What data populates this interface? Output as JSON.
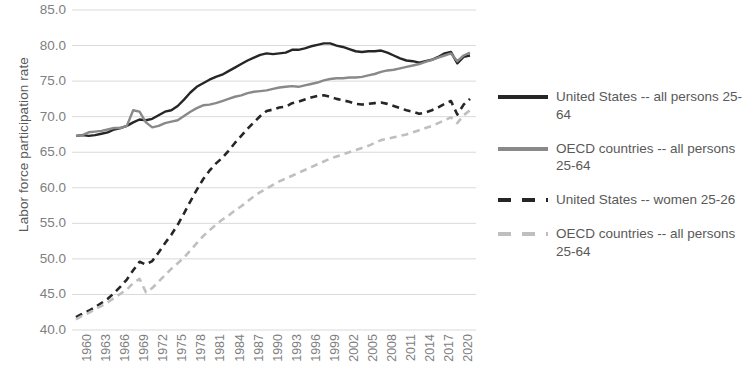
{
  "chart_data": {
    "type": "line",
    "title": "",
    "xlabel": "",
    "ylabel": "Labor force participation rate",
    "ylim": [
      40.0,
      85.0
    ],
    "ytick_step": 5.0,
    "ytick_labels": [
      "85.0",
      "80.0",
      "75.0",
      "70.0",
      "65.0",
      "60.0",
      "55.0",
      "50.0",
      "45.0",
      "40.0"
    ],
    "ytick_values": [
      85.0,
      80.0,
      75.0,
      70.0,
      65.0,
      60.0,
      55.0,
      50.0,
      45.0,
      40.0
    ],
    "xlim": [
      1960,
      2022
    ],
    "xtick_labels": [
      "1960",
      "1963",
      "1966",
      "1969",
      "1972",
      "1975",
      "1978",
      "1981",
      "1984",
      "1987",
      "1990",
      "1993",
      "1996",
      "1999",
      "2002",
      "2005",
      "2008",
      "2011",
      "2014",
      "2017",
      "2020"
    ],
    "xtick_values": [
      1960,
      1963,
      1966,
      1969,
      1972,
      1975,
      1978,
      1981,
      1984,
      1987,
      1990,
      1993,
      1996,
      1999,
      2002,
      2005,
      2008,
      2011,
      2014,
      2017,
      2020
    ],
    "grid": "horizontal",
    "legend_position": "right",
    "x": [
      1960,
      1961,
      1962,
      1963,
      1964,
      1965,
      1966,
      1967,
      1968,
      1969,
      1970,
      1971,
      1972,
      1973,
      1974,
      1975,
      1976,
      1977,
      1978,
      1979,
      1980,
      1981,
      1982,
      1983,
      1984,
      1985,
      1986,
      1987,
      1988,
      1989,
      1990,
      1991,
      1992,
      1993,
      1994,
      1995,
      1996,
      1997,
      1998,
      1999,
      2000,
      2001,
      2002,
      2003,
      2004,
      2005,
      2006,
      2007,
      2008,
      2009,
      2010,
      2011,
      2012,
      2013,
      2014,
      2015,
      2016,
      2017,
      2018,
      2019,
      2020,
      2021,
      2022
    ],
    "series": [
      {
        "name": "United States -- all persons 25-64",
        "color": "#262626",
        "style": "solid",
        "values": [
          67.3,
          67.4,
          67.3,
          67.4,
          67.6,
          67.8,
          68.2,
          68.4,
          68.7,
          69.2,
          69.6,
          69.5,
          69.7,
          70.2,
          70.7,
          70.9,
          71.5,
          72.4,
          73.4,
          74.2,
          74.7,
          75.2,
          75.6,
          75.9,
          76.4,
          76.9,
          77.4,
          77.9,
          78.3,
          78.7,
          78.9,
          78.8,
          78.9,
          79.0,
          79.4,
          79.4,
          79.6,
          79.9,
          80.1,
          80.3,
          80.3,
          80.0,
          79.8,
          79.5,
          79.2,
          79.1,
          79.2,
          79.2,
          79.3,
          79.0,
          78.6,
          78.2,
          77.9,
          77.8,
          77.6,
          77.8,
          78.0,
          78.4,
          78.9,
          79.1,
          77.5,
          78.4,
          78.6
        ]
      },
      {
        "name": "OECD countries -- all persons 25-64",
        "color": "#898989",
        "style": "solid",
        "values": [
          67.3,
          67.4,
          67.8,
          67.9,
          68.0,
          68.2,
          68.4,
          68.4,
          68.7,
          70.9,
          70.7,
          69.2,
          68.5,
          68.7,
          69.1,
          69.3,
          69.5,
          70.1,
          70.7,
          71.2,
          71.6,
          71.7,
          71.9,
          72.2,
          72.5,
          72.8,
          73.0,
          73.3,
          73.5,
          73.6,
          73.7,
          73.9,
          74.1,
          74.2,
          74.3,
          74.2,
          74.4,
          74.6,
          74.8,
          75.1,
          75.3,
          75.4,
          75.4,
          75.5,
          75.5,
          75.6,
          75.8,
          76.0,
          76.3,
          76.5,
          76.6,
          76.8,
          77.0,
          77.2,
          77.4,
          77.7,
          78.0,
          78.3,
          78.6,
          78.9,
          77.8,
          78.6,
          79.0
        ]
      },
      {
        "name": "United States -- women 25-26",
        "color": "#262626",
        "style": "dashed",
        "values": [
          41.8,
          42.3,
          42.7,
          43.2,
          43.8,
          44.4,
          45.2,
          46.1,
          47.1,
          48.4,
          49.6,
          49.2,
          49.7,
          50.9,
          52.2,
          53.4,
          54.8,
          56.4,
          58.1,
          59.7,
          61.2,
          62.4,
          63.4,
          64.2,
          65.2,
          66.3,
          67.3,
          68.3,
          69.2,
          70.1,
          70.8,
          71.0,
          71.3,
          71.4,
          71.9,
          72.1,
          72.4,
          72.7,
          72.9,
          73.0,
          72.8,
          72.5,
          72.3,
          72.1,
          71.8,
          71.7,
          71.8,
          71.9,
          72.0,
          71.8,
          71.5,
          71.2,
          70.9,
          70.7,
          70.4,
          70.6,
          70.9,
          71.3,
          71.8,
          72.2,
          70.3,
          71.7,
          72.5
        ]
      },
      {
        "name": "OECD countries -- all persons 25-64",
        "color": "#bfbfbf",
        "style": "dashed",
        "values": [
          41.5,
          42.0,
          42.4,
          42.9,
          43.4,
          43.9,
          44.5,
          45.1,
          45.7,
          46.6,
          47.2,
          45.3,
          45.9,
          46.8,
          47.7,
          48.6,
          49.4,
          50.2,
          51.2,
          52.2,
          53.2,
          54.0,
          54.8,
          55.5,
          56.1,
          56.8,
          57.4,
          58.1,
          58.8,
          59.4,
          59.9,
          60.4,
          60.9,
          61.3,
          61.7,
          62.1,
          62.5,
          62.9,
          63.3,
          63.7,
          64.1,
          64.4,
          64.7,
          65.0,
          65.3,
          65.6,
          65.9,
          66.3,
          66.7,
          66.9,
          67.1,
          67.3,
          67.5,
          67.8,
          68.1,
          68.4,
          68.7,
          69.1,
          69.5,
          69.9,
          69.1,
          70.2,
          70.9
        ]
      }
    ]
  },
  "legend": {
    "items": [
      {
        "label": "United States -- all persons 25-64",
        "color": "#262626",
        "style": "solid"
      },
      {
        "label": "OECD countries -- all persons 25-64",
        "color": "#898989",
        "style": "solid"
      },
      {
        "label": "United States -- women 25-26",
        "color": "#262626",
        "style": "dashed"
      },
      {
        "label": "OECD countries -- all persons 25-64",
        "color": "#bfbfbf",
        "style": "dashed"
      }
    ]
  },
  "colors": {
    "gridline": "#d9d9d9",
    "tick_text": "#808080",
    "axis_title": "#595959",
    "background": "#ffffff"
  }
}
